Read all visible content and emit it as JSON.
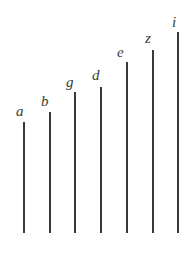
{
  "figure": {
    "width": 196,
    "height": 254,
    "background_color": "#ffffff",
    "line_color": "#3a3a3a",
    "label_color": "#3a3a3a",
    "line_width": 2,
    "label_font_size": 15,
    "baseline_y": 233
  },
  "chart_data": {
    "type": "bar",
    "title": "",
    "subtitle": "",
    "xlabel": "",
    "ylabel": "",
    "orientation": "vertical",
    "grid": false,
    "legend": null,
    "axes_visible": false,
    "categories": [
      "a",
      "b",
      "g",
      "d",
      "e",
      "z",
      "i"
    ],
    "values": [
      111,
      121,
      141,
      146,
      171,
      183,
      201
    ],
    "ylim": [
      0,
      254
    ],
    "note": "Values are pixel heights of each stem measured from the common baseline"
  },
  "stems": [
    {
      "label": "a",
      "line_x": 24,
      "top_y": 122,
      "bottom_y": 233,
      "height": 111,
      "label_x": 16,
      "label_y": 116
    },
    {
      "label": "b",
      "line_x": 50,
      "top_y": 112,
      "bottom_y": 233,
      "height": 121,
      "label_x": 41,
      "label_y": 106
    },
    {
      "label": "g",
      "line_x": 75,
      "top_y": 92,
      "bottom_y": 233,
      "height": 141,
      "label_x": 66,
      "label_y": 87
    },
    {
      "label": "d",
      "line_x": 101,
      "top_y": 87,
      "bottom_y": 233,
      "height": 146,
      "label_x": 92,
      "label_y": 80
    },
    {
      "label": "e",
      "line_x": 127,
      "top_y": 62,
      "bottom_y": 233,
      "height": 171,
      "label_x": 117,
      "label_y": 57
    },
    {
      "label": "z",
      "line_x": 153,
      "top_y": 50,
      "bottom_y": 233,
      "height": 183,
      "label_x": 145,
      "label_y": 43
    },
    {
      "label": "i",
      "line_x": 178,
      "top_y": 32,
      "bottom_y": 233,
      "height": 201,
      "label_x": 172,
      "label_y": 27
    }
  ]
}
